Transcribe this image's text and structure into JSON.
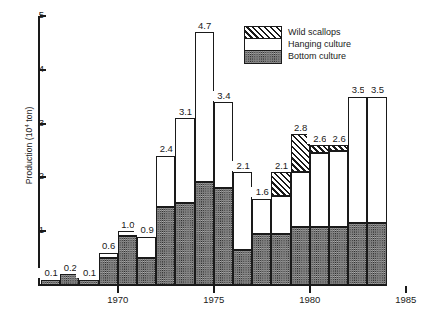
{
  "chart_data": {
    "type": "bar",
    "subtype": "stacked-bar",
    "title": "",
    "xlabel": "",
    "ylabel": "Production (10⁴ ton)",
    "ylabel_prefix": "Production (10",
    "ylabel_exponent": "4",
    "ylabel_suffix": " ton)",
    "ylim": [
      0,
      5
    ],
    "yticks": [
      1,
      2,
      3,
      4,
      5
    ],
    "ytick_labels": [
      "1",
      "2",
      "3",
      "4",
      "5"
    ],
    "grid": false,
    "xtick_labels": [
      "1970",
      "1975",
      "1980",
      "1985"
    ],
    "xtick_years": [
      1970,
      1975,
      1980,
      1985
    ],
    "categories": [
      1966,
      1967,
      1968,
      1969,
      1970,
      1971,
      1972,
      1973,
      1974,
      1975,
      1976,
      1977,
      1978,
      1979,
      1980,
      1981,
      1982,
      1983,
      1984,
      1985
    ],
    "legend_position": "top-right",
    "series": [
      {
        "name": "Bottom culture",
        "pattern": "dark-stipple",
        "color": "#2b2b2b",
        "values": [
          0.1,
          0.2,
          0.1,
          0.5,
          0.92,
          0.5,
          1.45,
          1.52,
          1.92,
          1.8,
          0.65,
          0.95,
          0.95,
          1.08,
          1.08,
          1.08,
          1.15,
          1.15,
          0.0,
          0.0
        ]
      },
      {
        "name": "Hanging culture",
        "pattern": "white",
        "color": "#ffffff",
        "values": [
          0.0,
          0.0,
          0.0,
          0.1,
          0.08,
          0.4,
          0.95,
          1.58,
          2.78,
          1.6,
          1.45,
          0.65,
          0.7,
          1.02,
          1.37,
          1.42,
          2.35,
          2.35,
          0.0,
          0.0
        ]
      },
      {
        "name": "Wild scallops",
        "pattern": "diagonal-hatch",
        "color": "#ffffff",
        "values": [
          0.0,
          0.0,
          0.0,
          0.0,
          0.0,
          0.0,
          0.0,
          0.0,
          0.0,
          0.0,
          0.0,
          0.0,
          0.45,
          0.7,
          0.15,
          0.1,
          0.0,
          0.0,
          0.0,
          0.0
        ]
      }
    ],
    "totals": [
      0.1,
      0.2,
      0.1,
      0.6,
      1.0,
      0.9,
      2.4,
      3.1,
      4.7,
      3.4,
      2.1,
      1.6,
      2.1,
      2.8,
      2.6,
      2.6,
      3.5,
      3.5
    ],
    "total_labels": [
      "0.1",
      "0.2",
      "0.1",
      "0.6",
      "1.0",
      "0.9",
      "2.4",
      "3.1",
      "4.7",
      "3.4",
      "2.1",
      "1.6",
      "2.1",
      "2.8",
      "2.6",
      "2.6",
      "3.5",
      "3.5"
    ]
  },
  "legend": {
    "entries": [
      {
        "label": "Wild scallops",
        "pattern": "diagonal-hatch"
      },
      {
        "label": "Hanging culture",
        "pattern": "white"
      },
      {
        "label": "Bottom culture",
        "pattern": "dark-stipple"
      }
    ]
  }
}
